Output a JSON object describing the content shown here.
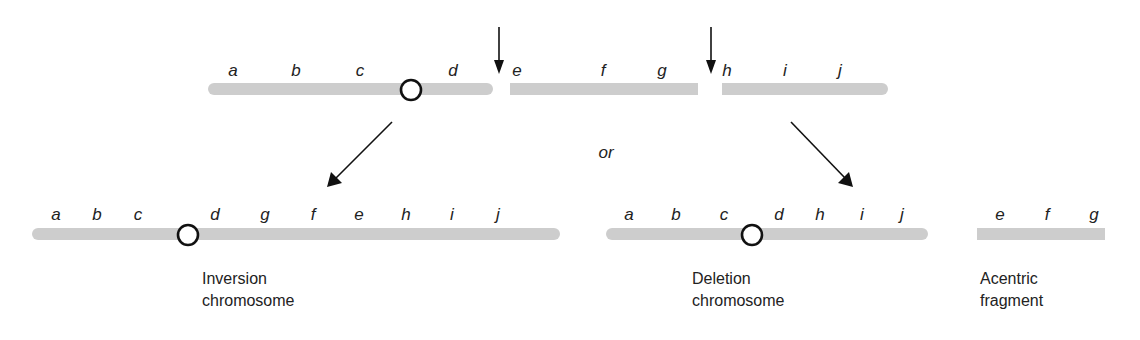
{
  "diagram": {
    "colors": {
      "chromosome": "#cdcdcd",
      "centromere_stroke": "#111111",
      "text": "#222222",
      "arrow": "#111111"
    },
    "original_chromosome": {
      "genes": [
        "a",
        "b",
        "c",
        "d",
        "e",
        "f",
        "g",
        "h",
        "i",
        "j"
      ],
      "centromere_between": [
        "c",
        "d"
      ],
      "break_points": [
        "between d and e",
        "between g and h"
      ]
    },
    "connector_text": "or",
    "products": [
      {
        "id": "inversion",
        "genes": [
          "a",
          "b",
          "c",
          "d",
          "g",
          "f",
          "e",
          "h",
          "i",
          "j"
        ],
        "caption_line1": "Inversion",
        "caption_line2": "chromosome"
      },
      {
        "id": "deletion",
        "genes": [
          "a",
          "b",
          "c",
          "d",
          "h",
          "i",
          "j"
        ],
        "caption_line1": "Deletion",
        "caption_line2": "chromosome"
      },
      {
        "id": "acentric",
        "genes": [
          "e",
          "f",
          "g"
        ],
        "caption_line1": "Acentric",
        "caption_line2": "fragment"
      }
    ]
  }
}
